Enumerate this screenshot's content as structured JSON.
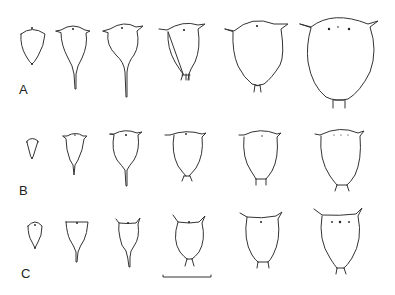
{
  "figure": {
    "rows": [
      {
        "label": "A",
        "specimen_count": 6
      },
      {
        "label": "B",
        "specimen_count": 6
      },
      {
        "label": "C",
        "specimen_count": 6
      }
    ],
    "scale_bar": {
      "label": ""
    }
  }
}
